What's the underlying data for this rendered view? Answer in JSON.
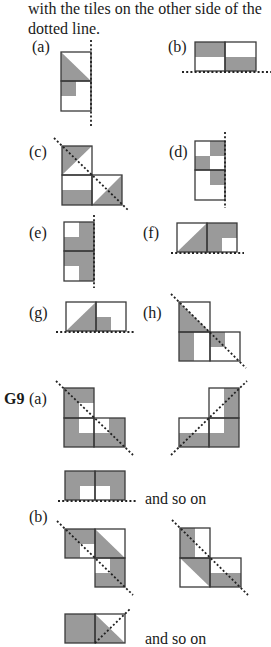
{
  "intro": {
    "line1": "with the tiles on the other side of the",
    "line2": "dotted line."
  },
  "labels": {
    "a": "(a)",
    "b": "(b)",
    "c": "(c)",
    "d": "(d)",
    "e": "(e)",
    "f": "(f)",
    "g": "(g)",
    "h": "(h)",
    "g9": "G9",
    "g9a": "(a)",
    "g9b": "(b)"
  },
  "captions": {
    "and_so_on_1": "and so on",
    "and_so_on_2": "and so on"
  },
  "colors": {
    "shade": "#9a9a9a",
    "outline": "#3a3a3a",
    "dots": "#222222"
  },
  "figures": [
    {
      "id": "a",
      "shapes": [
        {
          "t": "poly",
          "p": "61,52 91,81 61,81"
        },
        {
          "t": "rect",
          "x": 61,
          "y": 81,
          "w": 15,
          "h": 15
        }
      ],
      "rects": [
        [
          61,
          52,
          30,
          29
        ],
        [
          61,
          81,
          30,
          30
        ]
      ],
      "line": [
        91,
        40,
        91,
        127
      ]
    },
    {
      "id": "b",
      "shapes": [
        {
          "t": "rect",
          "x": 195,
          "y": 42,
          "w": 30,
          "h": 15
        },
        {
          "t": "rect",
          "x": 225,
          "y": 57,
          "w": 31,
          "h": 14
        }
      ],
      "rects": [
        [
          195,
          42,
          30,
          29
        ],
        [
          225,
          42,
          31,
          29
        ]
      ],
      "line": [
        182,
        72,
        271,
        72
      ]
    },
    {
      "id": "c",
      "shapes": [
        {
          "t": "poly",
          "p": "62,146 92,146 62,175"
        },
        {
          "t": "rect",
          "x": 62,
          "y": 190,
          "w": 30,
          "h": 15
        },
        {
          "t": "poly",
          "p": "122,175 122,205 92,205"
        }
      ],
      "rects": [
        [
          62,
          146,
          30,
          29
        ],
        [
          62,
          175,
          30,
          30
        ],
        [
          92,
          175,
          30,
          30
        ]
      ],
      "line": [
        54,
        138,
        128,
        210
      ]
    },
    {
      "id": "d",
      "shapes": [
        {
          "t": "rect",
          "x": 210,
          "y": 141,
          "w": 15,
          "h": 15
        },
        {
          "t": "rect",
          "x": 195,
          "y": 156,
          "w": 15,
          "h": 14
        },
        {
          "t": "rect",
          "x": 210,
          "y": 170,
          "w": 15,
          "h": 15
        }
      ],
      "rects": [
        [
          195,
          141,
          30,
          29
        ],
        [
          195,
          170,
          30,
          30
        ]
      ],
      "line": [
        225,
        132,
        225,
        208
      ]
    },
    {
      "id": "e",
      "shapes": [
        {
          "t": "poly",
          "p": "79,222 94,222 94,281 79,281 79,266 64,266 64,237 79,237"
        },
        {
          "t": "rect",
          "x": 64,
          "y": 237,
          "w": 15,
          "h": 29
        }
      ],
      "rects": [
        [
          64,
          222,
          30,
          29
        ],
        [
          64,
          251,
          30,
          30
        ]
      ],
      "line": [
        94,
        215,
        94,
        288
      ]
    },
    {
      "id": "f",
      "shapes": [
        {
          "t": "poly",
          "p": "177,252 207,223 207,252"
        },
        {
          "t": "poly",
          "p": "207,223 237,223 237,238 222,238 222,252 207,252"
        }
      ],
      "rects": [
        [
          177,
          223,
          30,
          29
        ],
        [
          207,
          223,
          30,
          29
        ]
      ],
      "line": [
        171,
        253,
        244,
        253
      ]
    },
    {
      "id": "g",
      "shapes": [
        {
          "t": "poly",
          "p": "66,331 96,302 96,331"
        },
        {
          "t": "rect",
          "x": 96,
          "y": 317,
          "w": 15,
          "h": 14
        }
      ],
      "rects": [
        [
          66,
          302,
          30,
          29
        ],
        [
          96,
          302,
          30,
          29
        ]
      ],
      "line": [
        56,
        332,
        134,
        332
      ]
    },
    {
      "id": "h",
      "shapes": [
        {
          "t": "poly",
          "p": "179,302 210,332 179,332"
        },
        {
          "t": "rect",
          "x": 179,
          "y": 332,
          "w": 15,
          "h": 29
        },
        {
          "t": "poly",
          "p": "210,332 225,332 225,347 210,347"
        }
      ],
      "rects": [
        [
          179,
          302,
          31,
          30
        ],
        [
          179,
          332,
          31,
          29
        ],
        [
          210,
          332,
          30,
          29
        ]
      ],
      "line": [
        171,
        294,
        246,
        368
      ]
    },
    {
      "id": "g9a-left",
      "shapes": [
        {
          "t": "poly",
          "p": "64,388 94,388 94,403 79,403 79,433 109,433 109,418 125,418 125,447 64,447"
        }
      ],
      "rects": [
        [
          64,
          388,
          30,
          30
        ],
        [
          64,
          418,
          30,
          29
        ],
        [
          94,
          418,
          31,
          29
        ]
      ],
      "line": [
        56,
        381,
        133,
        455
      ]
    },
    {
      "id": "g9a-right",
      "shapes": [
        {
          "t": "poly",
          "p": "224,388 239,388 239,447 179,447 179,433 224,433"
        }
      ],
      "rects": [
        [
          209,
          388,
          30,
          30
        ],
        [
          179,
          418,
          30,
          29
        ],
        [
          209,
          418,
          30,
          29
        ]
      ],
      "line": [
        171,
        455,
        247,
        381
      ]
    },
    {
      "id": "g9a-strip",
      "shapes": [
        {
          "t": "poly",
          "p": "65,471 125,471 125,500 110,500 110,486 80,486 80,500 65,500"
        }
      ],
      "rects": [
        [
          65,
          471,
          30,
          29
        ],
        [
          95,
          471,
          30,
          29
        ]
      ],
      "line": [
        58,
        501,
        137,
        501
      ]
    },
    {
      "id": "g9b-left",
      "shapes": [
        {
          "t": "poly",
          "p": "65,529 95,529 95,544 80,544 80,558 65,558"
        },
        {
          "t": "poly",
          "p": "95,529 125,558 95,558"
        },
        {
          "t": "poly",
          "p": "110,558 125,558 125,587 95,587 95,573 110,573"
        }
      ],
      "rects": [
        [
          65,
          529,
          30,
          29
        ],
        [
          95,
          529,
          30,
          29
        ],
        [
          95,
          558,
          30,
          29
        ]
      ],
      "line": [
        57,
        521,
        133,
        595
      ]
    },
    {
      "id": "g9b-right",
      "shapes": [
        {
          "t": "rect",
          "x": 180,
          "y": 528,
          "w": 15,
          "h": 30
        },
        {
          "t": "poly",
          "p": "180,558 210,558 210,587"
        },
        {
          "t": "rect",
          "x": 210,
          "y": 573,
          "w": 31,
          "h": 14
        }
      ],
      "rects": [
        [
          180,
          528,
          30,
          30
        ],
        [
          180,
          558,
          30,
          29
        ],
        [
          210,
          558,
          31,
          29
        ]
      ],
      "line": [
        172,
        520,
        248,
        595
      ]
    },
    {
      "id": "g9b-strip",
      "shapes": [
        {
          "t": "poly",
          "p": "65,614 95,614 95,643 80,643 80,629 95,629 95,643 65,643"
        },
        {
          "t": "poly",
          "p": "95,614 125,643 95,643"
        }
      ],
      "rects": [
        [
          65,
          614,
          30,
          29
        ],
        [
          95,
          614,
          30,
          29
        ]
      ],
      "line": [
        95,
        643,
        130,
        609
      ]
    }
  ]
}
